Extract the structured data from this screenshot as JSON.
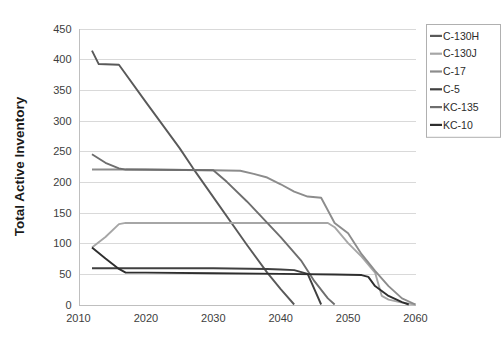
{
  "chart_data": {
    "type": "line",
    "title": "",
    "xlabel": "",
    "ylabel": "Total Active Inventory",
    "xlim": [
      2010,
      2060
    ],
    "ylim": [
      0,
      450
    ],
    "xticks": [
      "2010",
      "2020",
      "2030",
      "2040",
      "2050",
      "2060"
    ],
    "yticks": [
      "0",
      "50",
      "100",
      "150",
      "200",
      "250",
      "300",
      "350",
      "400",
      "450"
    ],
    "grid": true,
    "legend_position": "top-right",
    "series": [
      {
        "name": "C-130H",
        "color": "#595959",
        "points": [
          [
            2012,
            414
          ],
          [
            2013,
            392
          ],
          [
            2016,
            391
          ],
          [
            2020,
            330
          ],
          [
            2025,
            255
          ],
          [
            2027,
            222
          ],
          [
            2030,
            175
          ],
          [
            2035,
            97
          ],
          [
            2038,
            52
          ],
          [
            2040,
            25
          ],
          [
            2042,
            0
          ]
        ]
      },
      {
        "name": "C-130J",
        "color": "#a6a6a6",
        "points": [
          [
            2012,
            93
          ],
          [
            2014,
            110
          ],
          [
            2016,
            131
          ],
          [
            2017,
            133
          ],
          [
            2030,
            133
          ],
          [
            2040,
            133
          ],
          [
            2047,
            133
          ],
          [
            2048,
            126
          ],
          [
            2050,
            100
          ],
          [
            2052,
            78
          ],
          [
            2054,
            52
          ],
          [
            2055,
            14
          ],
          [
            2056,
            8
          ],
          [
            2058,
            3
          ],
          [
            2060,
            0
          ]
        ]
      },
      {
        "name": "C-17",
        "color": "#8c8c8c",
        "points": [
          [
            2012,
            220
          ],
          [
            2016,
            220
          ],
          [
            2020,
            220
          ],
          [
            2030,
            219
          ],
          [
            2034,
            218
          ],
          [
            2036,
            213
          ],
          [
            2038,
            207
          ],
          [
            2040,
            196
          ],
          [
            2042,
            184
          ],
          [
            2044,
            176
          ],
          [
            2046,
            174
          ],
          [
            2048,
            133
          ],
          [
            2050,
            116
          ],
          [
            2052,
            82
          ],
          [
            2054,
            55
          ],
          [
            2056,
            30
          ],
          [
            2058,
            10
          ],
          [
            2060,
            0
          ]
        ]
      },
      {
        "name": "C-5",
        "color": "#404040",
        "points": [
          [
            2012,
            59
          ],
          [
            2016,
            59
          ],
          [
            2020,
            59
          ],
          [
            2030,
            59
          ],
          [
            2038,
            58
          ],
          [
            2040,
            57
          ],
          [
            2042,
            56
          ],
          [
            2044,
            50
          ],
          [
            2046,
            0
          ]
        ]
      },
      {
        "name": "KC-135",
        "color": "#6e6e6e",
        "points": [
          [
            2012,
            245
          ],
          [
            2013,
            238
          ],
          [
            2014,
            231
          ],
          [
            2016,
            222
          ],
          [
            2017,
            220
          ],
          [
            2030,
            219
          ],
          [
            2032,
            200
          ],
          [
            2035,
            168
          ],
          [
            2040,
            110
          ],
          [
            2043,
            72
          ],
          [
            2045,
            38
          ],
          [
            2047,
            10
          ],
          [
            2048,
            0
          ]
        ]
      },
      {
        "name": "KC-10",
        "color": "#2e2e2e",
        "points": [
          [
            2012,
            93
          ],
          [
            2014,
            75
          ],
          [
            2016,
            58
          ],
          [
            2017,
            52
          ],
          [
            2020,
            52
          ],
          [
            2030,
            51
          ],
          [
            2040,
            50
          ],
          [
            2048,
            49
          ],
          [
            2052,
            48
          ],
          [
            2053,
            45
          ],
          [
            2054,
            30
          ],
          [
            2055,
            22
          ],
          [
            2056,
            14
          ],
          [
            2058,
            4
          ],
          [
            2059,
            0
          ]
        ]
      }
    ]
  },
  "legend": {
    "entries": [
      {
        "label": "C-130H",
        "color": "#595959"
      },
      {
        "label": "C-130J",
        "color": "#a6a6a6"
      },
      {
        "label": "C-17",
        "color": "#8c8c8c"
      },
      {
        "label": "C-5",
        "color": "#404040"
      },
      {
        "label": "KC-135",
        "color": "#6e6e6e"
      },
      {
        "label": "KC-10",
        "color": "#2e2e2e"
      }
    ]
  },
  "axes": {
    "y_title": "Total Active Inventory",
    "x_tick_labels": [
      "2010",
      "2020",
      "2030",
      "2040",
      "2050",
      "2060"
    ],
    "y_tick_labels": [
      "450",
      "400",
      "350",
      "300",
      "250",
      "200",
      "150",
      "100",
      "50",
      "0"
    ]
  }
}
